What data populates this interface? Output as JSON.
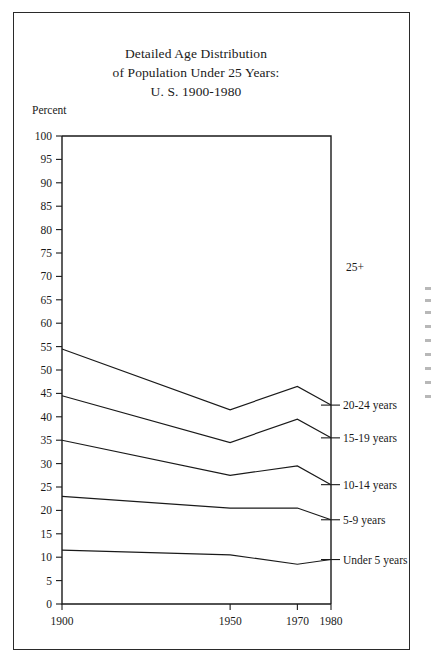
{
  "chart_data": {
    "type": "line",
    "title": "Detailed Age Distribution of Population Under 25 Years: U. S. 1900-1980",
    "title_lines": [
      "Detailed Age Distribution",
      "of Population Under 25 Years:",
      "U. S. 1900-1980"
    ],
    "xlabel": "",
    "ylabel": "Percent",
    "x": [
      1900,
      1950,
      1970,
      1980
    ],
    "xtick_labels": [
      "1900",
      "1950",
      "1970",
      "1980"
    ],
    "xlim": [
      1900,
      1980
    ],
    "ylim": [
      0,
      100
    ],
    "ytick_labels": [
      "0",
      "5",
      "10",
      "15",
      "20",
      "25",
      "30",
      "35",
      "40",
      "45",
      "50",
      "55",
      "60",
      "65",
      "70",
      "75",
      "80",
      "85",
      "90",
      "95",
      "100"
    ],
    "ytick_values": [
      0,
      5,
      10,
      15,
      20,
      25,
      30,
      35,
      40,
      45,
      50,
      55,
      60,
      65,
      70,
      75,
      80,
      85,
      90,
      95,
      100
    ],
    "grid": false,
    "legend_position": "right-of-plot",
    "note": "Cumulative stacked boundary lines; each line is the upper edge of a cumulative age band. Top region above the highest line is the 25+ group.",
    "series": [
      {
        "name": "20-24 years",
        "label": "20-24 years",
        "values": [
          54.5,
          41.5,
          46.5,
          42.5
        ]
      },
      {
        "name": "15-19 years",
        "label": "15-19 years",
        "values": [
          44.5,
          34.5,
          39.5,
          35.5
        ]
      },
      {
        "name": "10-14 years",
        "label": "10-14 years",
        "values": [
          35.0,
          27.5,
          29.5,
          25.5
        ]
      },
      {
        "name": "5-9 years",
        "label": "5-9 years",
        "values": [
          23.0,
          20.5,
          20.5,
          18.0
        ]
      },
      {
        "name": "Under 5 years",
        "label": "Under 5 years",
        "values": [
          11.5,
          10.5,
          8.5,
          9.5
        ]
      }
    ],
    "region_labels": [
      {
        "text": "25+",
        "value": 72
      }
    ],
    "colors": {
      "line": "#1a1a1a",
      "axis": "#1a1a1a",
      "background": "#ffffff"
    }
  }
}
